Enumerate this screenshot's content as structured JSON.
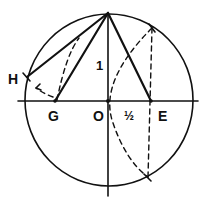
{
  "diagram": {
    "title": "",
    "colors": {
      "ink": "#111111",
      "background": "#ffffff"
    },
    "points": {
      "top": {
        "label": "",
        "x": 108,
        "y": 13
      },
      "H": {
        "label": "H",
        "x": 26,
        "y": 77
      },
      "G": {
        "label": "G",
        "x": 55,
        "y": 101
      },
      "O": {
        "label": "O",
        "x": 108,
        "y": 101
      },
      "E": {
        "label": "E",
        "x": 151,
        "y": 101
      },
      "upper_intersection": {
        "label": "",
        "x": 152,
        "y": 28
      },
      "lower_intersection": {
        "label": "",
        "x": 148,
        "y": 177
      }
    },
    "labels": {
      "H": "H",
      "G": "G",
      "O": "O",
      "E": "E",
      "one": "1",
      "half": "½"
    },
    "circle": {
      "cx": 108,
      "cy": 100,
      "r": 86
    }
  }
}
